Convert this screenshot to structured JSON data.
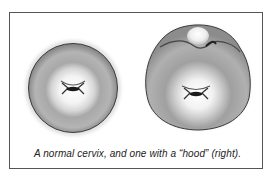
{
  "figure": {
    "caption": "A normal cervix, and one with a “hood” (right).",
    "panels": [
      {
        "label": "normal-cervix",
        "description": "Round cervix with central os"
      },
      {
        "label": "hooded-cervix",
        "description": "Cervix with hood-like fold at top"
      }
    ]
  },
  "colors": {
    "border": "#555555",
    "outline": "#3a3a3a",
    "tissue_outer": "#9a9a9a",
    "tissue_inner": "#f2f2f2",
    "os": "#1a1a1a"
  }
}
